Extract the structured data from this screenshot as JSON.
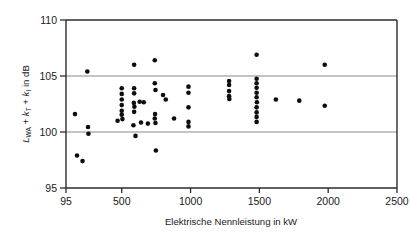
{
  "chart_data": {
    "type": "scatter",
    "title": "",
    "xlabel": "Elektrische Nennleistung in kW",
    "ylabel": "L_WA + k_T + k_I in dB",
    "ylabel_parts": {
      "symbol1": "L",
      "symbol1_sub": "WA",
      "plus1": " + ",
      "symbol2": "k",
      "symbol2_sub": "T",
      "plus2": " + ",
      "symbol3": "k",
      "symbol3_sub": "I",
      "tail": " in dB"
    },
    "xlim": [
      95,
      2500
    ],
    "ylim": [
      95,
      110
    ],
    "xticks": [
      95,
      500,
      1000,
      1500,
      2000,
      2500
    ],
    "xtick_labels": [
      "95",
      "500",
      "1000",
      "1500",
      "2000",
      "2500"
    ],
    "yticks": [
      95,
      100,
      105,
      110
    ],
    "ytick_labels": [
      "95",
      "100",
      "105",
      "110"
    ],
    "gridlines_y": [
      100,
      105
    ],
    "grid": "horizontal-only",
    "legend": "none",
    "marker": "filled-circle",
    "marker_color": "#0d0d0d",
    "marker_size_px": 4.6,
    "n_points": 66,
    "points": [
      [
        160,
        101.6
      ],
      [
        175,
        97.9
      ],
      [
        215,
        97.4
      ],
      [
        250,
        105.4
      ],
      [
        255,
        100.45
      ],
      [
        258,
        99.85
      ],
      [
        470,
        101.0
      ],
      [
        500,
        103.9
      ],
      [
        500,
        103.4
      ],
      [
        500,
        102.9
      ],
      [
        500,
        102.4
      ],
      [
        500,
        101.9
      ],
      [
        500,
        101.55
      ],
      [
        505,
        101.15
      ],
      [
        590,
        106.0
      ],
      [
        590,
        103.9
      ],
      [
        590,
        103.45
      ],
      [
        588,
        102.6
      ],
      [
        592,
        102.25
      ],
      [
        590,
        101.8
      ],
      [
        585,
        100.6
      ],
      [
        600,
        99.65
      ],
      [
        630,
        102.7
      ],
      [
        640,
        100.85
      ],
      [
        660,
        102.65
      ],
      [
        690,
        100.75
      ],
      [
        740,
        106.4
      ],
      [
        740,
        104.35
      ],
      [
        745,
        103.75
      ],
      [
        742,
        101.6
      ],
      [
        740,
        101.2
      ],
      [
        745,
        100.8
      ],
      [
        748,
        98.35
      ],
      [
        800,
        103.3
      ],
      [
        820,
        102.9
      ],
      [
        880,
        101.2
      ],
      [
        985,
        104.05
      ],
      [
        985,
        103.5
      ],
      [
        985,
        102.2
      ],
      [
        985,
        100.9
      ],
      [
        985,
        100.5
      ],
      [
        1280,
        104.55
      ],
      [
        1280,
        104.2
      ],
      [
        1280,
        103.65
      ],
      [
        1280,
        103.2
      ],
      [
        1282,
        102.95
      ],
      [
        1480,
        106.9
      ],
      [
        1480,
        104.75
      ],
      [
        1480,
        104.35
      ],
      [
        1480,
        103.95
      ],
      [
        1480,
        103.5
      ],
      [
        1480,
        103.1
      ],
      [
        1482,
        102.65
      ],
      [
        1480,
        102.2
      ],
      [
        1480,
        101.75
      ],
      [
        1480,
        101.35
      ],
      [
        1480,
        100.9
      ],
      [
        1620,
        102.9
      ],
      [
        1790,
        102.8
      ],
      [
        1975,
        106.0
      ],
      [
        1975,
        102.35
      ]
    ]
  }
}
